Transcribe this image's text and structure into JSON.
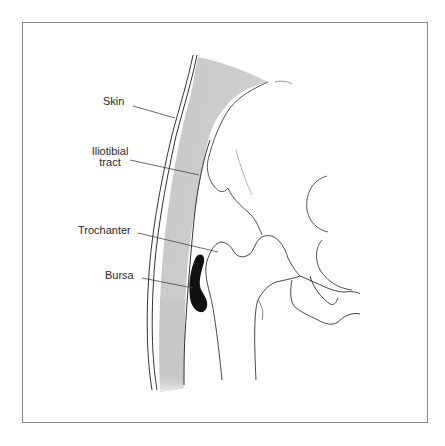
{
  "diagram": {
    "labels": [
      {
        "id": "skin",
        "text": "Skin"
      },
      {
        "id": "iliotibial",
        "line1": "Iliotibial",
        "line2": "tract"
      },
      {
        "id": "trochanter",
        "text": "Trochanter"
      },
      {
        "id": "bursa",
        "text": "Bursa"
      }
    ],
    "colors": {
      "tissue_band": "#c9c9c9",
      "bursa": "#111111",
      "outline": "#333333",
      "frame": "#8a8a8a",
      "leader_line": "#444444"
    }
  }
}
